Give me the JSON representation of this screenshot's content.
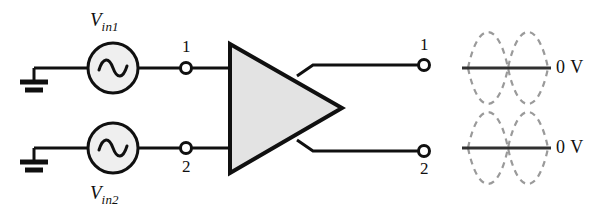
{
  "diagram": {
    "background_color": "#ffffff",
    "line_color": "#101010",
    "amplifier_fill": "#e3e3e3",
    "waveform_color": "#8a8a8a"
  },
  "sources": [
    {
      "name": "source-vin1",
      "label_v": "V",
      "label_sub": "in1",
      "symbol": "sine-source",
      "cx": 113,
      "cy": 68
    },
    {
      "name": "source-vin2",
      "label_v": "V",
      "label_sub": "in2",
      "symbol": "sine-source",
      "cx": 113,
      "cy": 148
    }
  ],
  "grounds": [
    {
      "name": "ground-top",
      "symbol": "ground-icon"
    },
    {
      "name": "ground-bottom",
      "symbol": "ground-icon"
    }
  ],
  "input_terminals": [
    {
      "name": "input-terminal-1",
      "label": "1"
    },
    {
      "name": "input-terminal-2",
      "label": "2"
    }
  ],
  "amplifier": {
    "name": "amplifier-triangle",
    "shape": "triangle",
    "fill": "#e3e3e3"
  },
  "output_terminals": [
    {
      "name": "output-terminal-1",
      "label": "1"
    },
    {
      "name": "output-terminal-2",
      "label": "2"
    }
  ],
  "waveforms": [
    {
      "name": "output-waveform-1",
      "type": "dashed-double-sine",
      "axis_label": "0 V",
      "cycles": 1,
      "inverted_pair": true
    },
    {
      "name": "output-waveform-2",
      "type": "dashed-double-sine",
      "axis_label": "0 V",
      "cycles": 1,
      "inverted_pair": true
    }
  ]
}
